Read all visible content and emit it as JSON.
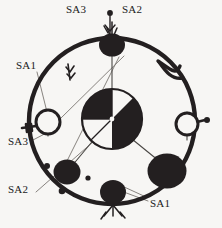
{
  "figure": {
    "name": "circular-node-diagram",
    "background_color": "#f7f6f4",
    "ink_color": "#231f20",
    "thin_line_color": "#6e6a67",
    "width": 222,
    "height": 228
  },
  "labels": [
    {
      "id": "label-sa3-top",
      "text": "SA3",
      "x": 84,
      "y": 7,
      "anchor": "end-top"
    },
    {
      "id": "label-sa2-top",
      "text": "SA2",
      "x": 124,
      "y": 7,
      "anchor": "start-top"
    },
    {
      "id": "label-sa1-left",
      "text": "SA1",
      "x": 18,
      "y": 66,
      "anchor": "start-left"
    },
    {
      "id": "label-sa3-left",
      "text": "SA3",
      "x": 12,
      "y": 143,
      "anchor": "start-left"
    },
    {
      "id": "label-sa2-bottom",
      "text": "SA2",
      "x": 12,
      "y": 188,
      "anchor": "start-left"
    },
    {
      "id": "label-sa1-bottom",
      "text": "SA1",
      "x": 148,
      "y": 203,
      "anchor": "start-right"
    }
  ],
  "ring": {
    "center_x": 112,
    "center_y": 121,
    "radius": 83,
    "stroke_width": 4.2
  },
  "center_circle": {
    "cx": 112,
    "cy": 119,
    "r": 30,
    "quadrants": [
      {
        "position": "upper-left",
        "fill": "dark"
      },
      {
        "position": "upper-right",
        "fill": "light"
      },
      {
        "position": "lower-left",
        "fill": "light"
      },
      {
        "position": "lower-right",
        "fill": "dark"
      }
    ]
  },
  "nodes": [
    {
      "id": "node-top",
      "kind": "filled-blob",
      "cx": 112,
      "cy": 45,
      "rx": 13,
      "ry": 11,
      "ornament": "antennae-up"
    },
    {
      "id": "node-right",
      "kind": "open-circle",
      "cx": 187,
      "cy": 124,
      "r": 11,
      "ornament": "stub-dot-right"
    },
    {
      "id": "node-lower-right",
      "kind": "filled-blob",
      "cx": 167,
      "cy": 171,
      "rx": 19,
      "ry": 17,
      "ornament": "none"
    },
    {
      "id": "node-bottom",
      "kind": "filled-blob",
      "cx": 113,
      "cy": 193,
      "rx": 13,
      "ry": 12,
      "ornament": "roots-down"
    },
    {
      "id": "node-lower-left",
      "kind": "filled-blob",
      "cx": 67,
      "cy": 172,
      "rx": 13,
      "ry": 12,
      "ornament": "none"
    },
    {
      "id": "node-left",
      "kind": "open-circle",
      "cx": 48,
      "cy": 122,
      "r": 12,
      "ornament": "key-stub-left"
    }
  ],
  "speckles": [
    {
      "id": "speckle-1",
      "cx": 47,
      "cy": 166,
      "r": 3.0
    },
    {
      "id": "speckle-2",
      "cx": 62,
      "cy": 190,
      "r": 3.2
    },
    {
      "id": "speckle-3",
      "cx": 87,
      "cy": 178,
      "r": 2.6
    },
    {
      "id": "speckle-4",
      "cx": 110,
      "cy": 12,
      "r": 2.8
    },
    {
      "id": "speckle-5",
      "cx": 199,
      "cy": 121,
      "r": 2.8
    }
  ],
  "spokes": [
    {
      "id": "spoke-top",
      "x1": 112,
      "y1": 47,
      "x2": 112,
      "y2": 90
    },
    {
      "id": "spoke-lower-left",
      "x1": 95,
      "y1": 138,
      "x2": 70,
      "y2": 168
    },
    {
      "id": "spoke-lower-right",
      "x1": 128,
      "y1": 136,
      "x2": 160,
      "y2": 162
    }
  ],
  "leaders": [
    {
      "id": "leader-sa1-left",
      "x1": 37,
      "y1": 72,
      "x2": 47,
      "y2": 112
    },
    {
      "id": "leader-sa3-left",
      "x1": 34,
      "y1": 140,
      "x2": 55,
      "y2": 128
    },
    {
      "id": "leader-sa2-bottom",
      "x1": 37,
      "y1": 190,
      "x2": 92,
      "y2": 140
    },
    {
      "id": "leader-sa1-bottom",
      "x1": 146,
      "y1": 200,
      "x2": 122,
      "y2": 190
    },
    {
      "id": "leader-sa2-top",
      "x1": 110,
      "y1": 14,
      "x2": 110,
      "y2": 36
    },
    {
      "id": "leader-chord",
      "x1": 59,
      "y1": 120,
      "x2": 124,
      "y2": 56
    },
    {
      "id": "leader-chord-2",
      "x1": 66,
      "y1": 163,
      "x2": 118,
      "y2": 58
    }
  ],
  "ornaments": {
    "arc_tick": {
      "id": "arc-tick-upper-left",
      "cx": 70,
      "cy": 72
    },
    "hook": {
      "id": "hook-upper-right",
      "cx": 168,
      "cy": 74
    }
  }
}
